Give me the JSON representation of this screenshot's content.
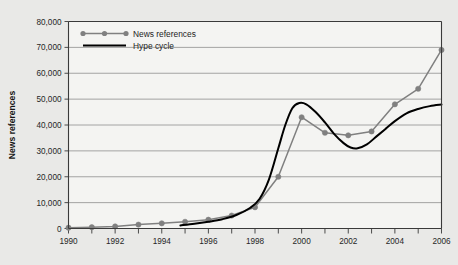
{
  "chart_data": {
    "type": "line",
    "title": "",
    "xlabel": "",
    "ylabel": "News references",
    "xlim": [
      1990,
      2006
    ],
    "ylim": [
      0,
      80000
    ],
    "grid": true,
    "legend_position": "top-left inside plot",
    "x": [
      1990,
      1991,
      1992,
      1993,
      1994,
      1995,
      1996,
      1997,
      1998,
      1999,
      2000,
      2001,
      2002,
      2003,
      2004,
      2005,
      2006
    ],
    "xtick_labels": [
      "1990",
      "1992",
      "1994",
      "1996",
      "1998",
      "2000",
      "2002",
      "2004",
      "2006"
    ],
    "xtick_values": [
      1990,
      1992,
      1994,
      1996,
      1998,
      2000,
      2002,
      2004,
      2006
    ],
    "xtick_minor_values": [
      1991,
      1993,
      1995,
      1997,
      1999,
      2001,
      2003,
      2005
    ],
    "ytick_labels": [
      "0",
      "10,000",
      "20,000",
      "30,000",
      "40,000",
      "50,000",
      "60,000",
      "70,000",
      "80,000"
    ],
    "ytick_values": [
      0,
      10000,
      20000,
      30000,
      40000,
      50000,
      60000,
      70000,
      80000
    ],
    "series": [
      {
        "name": "News references",
        "style": "line-with-markers",
        "color": "#808080",
        "marker": "circle",
        "values": [
          300,
          500,
          800,
          1500,
          2000,
          2600,
          3400,
          5000,
          8200,
          20000,
          43000,
          37000,
          36000,
          37500,
          48000,
          54000,
          69000
        ]
      },
      {
        "name": "Hype cycle",
        "style": "smooth-line",
        "color": "#000000",
        "marker": "none",
        "x": [
          1994.8,
          1995.4,
          1996.0,
          1996.6,
          1997.2,
          1997.8,
          1998.2,
          1998.6,
          1999.0,
          1999.3,
          1999.6,
          1999.9,
          2000.2,
          2000.6,
          2001.0,
          2001.4,
          2001.8,
          2002.1,
          2002.4,
          2002.8,
          2003.2,
          2003.6,
          2004.0,
          2004.5,
          2005.0,
          2005.5,
          2006.0
        ],
        "values": [
          1200,
          1800,
          2600,
          3600,
          5200,
          8000,
          11500,
          19000,
          31000,
          40000,
          46500,
          48500,
          48000,
          45000,
          41000,
          36500,
          33000,
          31300,
          31000,
          32500,
          35500,
          38500,
          41500,
          44500,
          46200,
          47300,
          47900
        ]
      }
    ]
  },
  "legend": {
    "items": [
      {
        "label": "News references"
      },
      {
        "label": "Hype cycle"
      }
    ]
  },
  "axes": {
    "y_axis_title": "News references"
  },
  "colors": {
    "background": "#e9e9e7",
    "plot_background": "#f4f4f2",
    "grid": "#9a9a9a",
    "axis": "#3a3a3a",
    "news_series": "#808080",
    "hype_series": "#000000",
    "text": "#1d1d1d"
  }
}
